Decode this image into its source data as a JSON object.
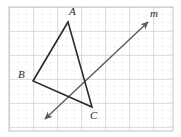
{
  "figure": {
    "width": 181,
    "height": 137,
    "background_color": "#ffffff"
  },
  "grid": {
    "minor_spacing": 8,
    "major_spacing": 24,
    "minor_color": "#d9d9de",
    "major_color": "#c2c2ca",
    "minor_style": "dotted",
    "major_style": "solid",
    "origin_x": 9,
    "origin_y": 7,
    "right": 173,
    "bottom": 131
  },
  "shape": {
    "name": "triangle",
    "stroke_color": "#2b2b2b",
    "stroke_width": 1.6,
    "fill": "none",
    "vertices": [
      {
        "label": "A",
        "x": 68,
        "y": 22
      },
      {
        "label": "B",
        "x": 33,
        "y": 81
      },
      {
        "label": "C",
        "x": 92,
        "y": 107
      }
    ],
    "edges": [
      {
        "from": "A",
        "to": "B"
      },
      {
        "from": "B",
        "to": "C"
      },
      {
        "from": "C",
        "to": "A"
      }
    ]
  },
  "line": {
    "label": "m",
    "stroke_color": "#5a5a62",
    "stroke_width": 1.4,
    "arrow_start": {
      "x": 45,
      "y": 119
    },
    "arrow_end": {
      "x": 148,
      "y": 22
    },
    "arrowheads": "both"
  },
  "labels": {
    "vertex_a": {
      "text": "A",
      "x": 69,
      "y": 8
    },
    "vertex_b": {
      "text": "B",
      "x": 19,
      "y": 71
    },
    "vertex_c": {
      "text": "C",
      "x": 90,
      "y": 111
    },
    "line_m": {
      "text": "m",
      "x": 150,
      "y": 10
    }
  }
}
